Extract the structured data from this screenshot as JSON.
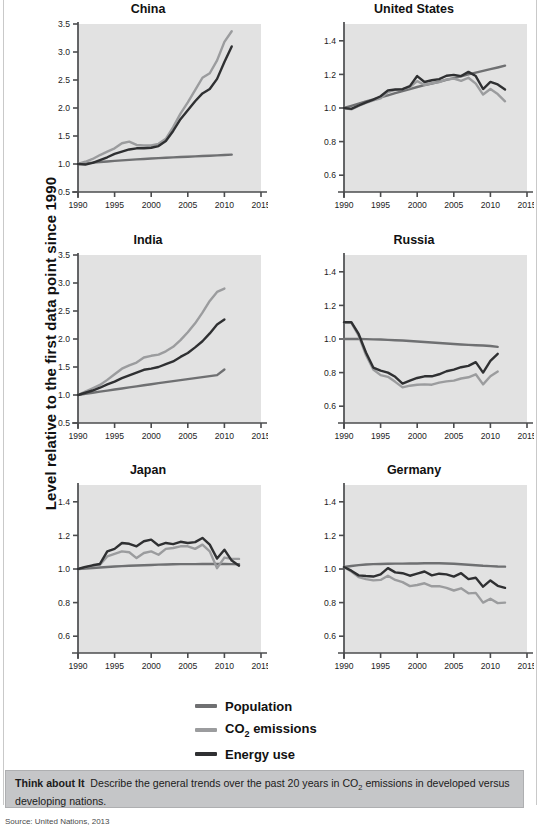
{
  "figure": {
    "ylabel": "Level relative to the first data point since 1990",
    "source": "Source: United Nations, 2013"
  },
  "legend": {
    "position": "bottom-center",
    "items": [
      {
        "label": "Population",
        "color": "#6f7072",
        "key": "population"
      },
      {
        "label": "CO2 emissions",
        "label_pre": "CO",
        "label_sub": "2",
        "label_post": " emissions",
        "color": "#9b9c9e",
        "key": "co2"
      },
      {
        "label": "Energy use",
        "color": "#2f3032",
        "key": "energy"
      }
    ]
  },
  "think_about_it": {
    "heading": "Think about It",
    "body_pre": "Describe the general trends over the past 20 years in CO",
    "body_sub": "2",
    "body_post": " emissions in developed versus developing nations."
  },
  "chart_data": [
    {
      "type": "line",
      "title": "China",
      "xlabel": "",
      "ylabel": "Level relative to the first data point since 1990",
      "xlim": [
        1990,
        2015
      ],
      "ylim": [
        0.5,
        3.5
      ],
      "xticks": [
        1990,
        1995,
        2000,
        2005,
        2010,
        2015
      ],
      "yticks": [
        0.5,
        1.0,
        1.5,
        2.0,
        2.5,
        3.0,
        3.5
      ],
      "grid": false,
      "x": [
        1990,
        1991,
        1992,
        1993,
        1994,
        1995,
        1996,
        1997,
        1998,
        1999,
        2000,
        2001,
        2002,
        2003,
        2004,
        2005,
        2006,
        2007,
        2008,
        2009,
        2010,
        2011
      ],
      "series": [
        {
          "name": "Population",
          "color": "#6f7072",
          "values": [
            1.0,
            1.012,
            1.024,
            1.035,
            1.045,
            1.055,
            1.065,
            1.074,
            1.082,
            1.09,
            1.098,
            1.105,
            1.112,
            1.118,
            1.124,
            1.13,
            1.136,
            1.142,
            1.148,
            1.154,
            1.161,
            1.168
          ]
        },
        {
          "name": "CO2 emissions",
          "color": "#9b9c9e",
          "values": [
            1.0,
            1.04,
            1.09,
            1.16,
            1.22,
            1.28,
            1.37,
            1.4,
            1.34,
            1.33,
            1.33,
            1.36,
            1.45,
            1.66,
            1.9,
            2.1,
            2.32,
            2.54,
            2.62,
            2.85,
            3.18,
            3.37
          ]
        },
        {
          "name": "Energy use",
          "color": "#2f3032",
          "values": [
            1.0,
            0.99,
            1.02,
            1.07,
            1.12,
            1.18,
            1.22,
            1.26,
            1.28,
            1.28,
            1.29,
            1.32,
            1.41,
            1.59,
            1.8,
            1.96,
            2.12,
            2.26,
            2.34,
            2.52,
            2.82,
            3.1
          ]
        }
      ]
    },
    {
      "type": "line",
      "title": "United States",
      "xlabel": "",
      "ylabel": "",
      "xlim": [
        1990,
        2015
      ],
      "ylim": [
        0.5,
        1.5
      ],
      "xticks": [
        1990,
        1995,
        2000,
        2005,
        2010,
        2015
      ],
      "yticks": [
        0.6,
        0.8,
        1.0,
        1.2,
        1.4
      ],
      "grid": false,
      "x": [
        1990,
        1991,
        1992,
        1993,
        1994,
        1995,
        1996,
        1997,
        1998,
        1999,
        2000,
        2001,
        2002,
        2003,
        2004,
        2005,
        2006,
        2007,
        2008,
        2009,
        2010,
        2011,
        2012
      ],
      "series": [
        {
          "name": "Population",
          "color": "#6f7072",
          "values": [
            1.0,
            1.013,
            1.026,
            1.039,
            1.051,
            1.063,
            1.075,
            1.088,
            1.1,
            1.112,
            1.125,
            1.136,
            1.146,
            1.156,
            1.167,
            1.178,
            1.189,
            1.2,
            1.211,
            1.221,
            1.231,
            1.241,
            1.252
          ]
        },
        {
          "name": "CO2 emissions",
          "color": "#9b9c9e",
          "values": [
            1.0,
            0.992,
            1.012,
            1.03,
            1.046,
            1.058,
            1.095,
            1.108,
            1.112,
            1.124,
            1.16,
            1.137,
            1.147,
            1.154,
            1.17,
            1.175,
            1.162,
            1.18,
            1.145,
            1.08,
            1.113,
            1.083,
            1.04
          ]
        },
        {
          "name": "Energy use",
          "color": "#2f3032",
          "values": [
            1.0,
            0.995,
            1.015,
            1.034,
            1.05,
            1.07,
            1.105,
            1.11,
            1.112,
            1.13,
            1.19,
            1.155,
            1.165,
            1.172,
            1.192,
            1.197,
            1.19,
            1.215,
            1.19,
            1.113,
            1.155,
            1.14,
            1.11
          ]
        }
      ]
    },
    {
      "type": "line",
      "title": "India",
      "xlabel": "",
      "ylabel": "",
      "xlim": [
        1990,
        2015
      ],
      "ylim": [
        0.5,
        3.5
      ],
      "xticks": [
        1990,
        1995,
        2000,
        2005,
        2010,
        2015
      ],
      "yticks": [
        0.5,
        1.0,
        1.5,
        2.0,
        2.5,
        3.0,
        3.5
      ],
      "grid": false,
      "x": [
        1990,
        1991,
        1992,
        1993,
        1994,
        1995,
        1996,
        1997,
        1998,
        1999,
        2000,
        2001,
        2002,
        2003,
        2004,
        2005,
        2006,
        2007,
        2008,
        2009,
        2010
      ],
      "series": [
        {
          "name": "Population",
          "color": "#6f7072",
          "values": [
            1.0,
            1.02,
            1.04,
            1.06,
            1.079,
            1.098,
            1.117,
            1.136,
            1.155,
            1.174,
            1.193,
            1.211,
            1.229,
            1.247,
            1.265,
            1.283,
            1.301,
            1.319,
            1.337,
            1.355,
            1.455
          ]
        },
        {
          "name": "CO2 emissions",
          "color": "#9b9c9e",
          "values": [
            1.0,
            1.06,
            1.12,
            1.18,
            1.27,
            1.37,
            1.47,
            1.53,
            1.58,
            1.67,
            1.7,
            1.72,
            1.78,
            1.86,
            1.98,
            2.12,
            2.28,
            2.47,
            2.68,
            2.84,
            2.9
          ]
        },
        {
          "name": "Energy use",
          "color": "#2f3032",
          "values": [
            1.0,
            1.04,
            1.08,
            1.13,
            1.19,
            1.24,
            1.3,
            1.35,
            1.4,
            1.45,
            1.47,
            1.5,
            1.55,
            1.6,
            1.68,
            1.75,
            1.85,
            1.96,
            2.1,
            2.26,
            2.35
          ]
        }
      ]
    },
    {
      "type": "line",
      "title": "Russia",
      "xlabel": "",
      "ylabel": "",
      "xlim": [
        1990,
        2015
      ],
      "ylim": [
        0.5,
        1.5
      ],
      "xticks": [
        1990,
        1995,
        2000,
        2005,
        2010,
        2015
      ],
      "yticks": [
        0.6,
        0.8,
        1.0,
        1.2,
        1.4
      ],
      "grid": false,
      "x": [
        1990,
        1991,
        1992,
        1993,
        1994,
        1995,
        1996,
        1997,
        1998,
        1999,
        2000,
        2001,
        2002,
        2003,
        2004,
        2005,
        2006,
        2007,
        2008,
        2009,
        2010,
        2011
      ],
      "series": [
        {
          "name": "Population",
          "color": "#6f7072",
          "values": [
            1.0,
            1.0,
            1.0,
            0.999,
            0.998,
            0.997,
            0.995,
            0.993,
            0.991,
            0.988,
            0.985,
            0.982,
            0.979,
            0.976,
            0.973,
            0.97,
            0.967,
            0.965,
            0.963,
            0.961,
            0.958,
            0.953
          ]
        },
        {
          "name": "CO2 emissions",
          "color": "#9b9c9e",
          "values": [
            1.1,
            1.098,
            1.02,
            0.905,
            0.818,
            0.785,
            0.775,
            0.745,
            0.712,
            0.722,
            0.728,
            0.73,
            0.728,
            0.74,
            0.748,
            0.752,
            0.765,
            0.772,
            0.79,
            0.73,
            0.778,
            0.806
          ]
        },
        {
          "name": "Energy use",
          "color": "#2f3032",
          "values": [
            1.1,
            1.1,
            1.03,
            0.92,
            0.83,
            0.812,
            0.8,
            0.775,
            0.735,
            0.752,
            0.768,
            0.778,
            0.778,
            0.79,
            0.808,
            0.818,
            0.832,
            0.84,
            0.862,
            0.8,
            0.87,
            0.912
          ]
        }
      ]
    },
    {
      "type": "line",
      "title": "Japan",
      "xlabel": "",
      "ylabel": "",
      "xlim": [
        1990,
        2015
      ],
      "ylim": [
        0.5,
        1.5
      ],
      "xticks": [
        1990,
        1995,
        2000,
        2005,
        2010,
        2015
      ],
      "yticks": [
        0.6,
        0.8,
        1.0,
        1.2,
        1.4
      ],
      "grid": false,
      "x": [
        1990,
        1991,
        1992,
        1993,
        1994,
        1995,
        1996,
        1997,
        1998,
        1999,
        2000,
        2001,
        2002,
        2003,
        2004,
        2005,
        2006,
        2007,
        2008,
        2009,
        2010,
        2011,
        2012
      ],
      "series": [
        {
          "name": "Population",
          "color": "#6f7072",
          "values": [
            1.0,
            1.003,
            1.006,
            1.009,
            1.012,
            1.015,
            1.017,
            1.019,
            1.021,
            1.022,
            1.024,
            1.026,
            1.027,
            1.028,
            1.029,
            1.029,
            1.029,
            1.03,
            1.03,
            1.03,
            1.03,
            1.029,
            1.028
          ]
        },
        {
          "name": "CO2 emissions",
          "color": "#9b9c9e",
          "values": [
            1.0,
            1.01,
            1.02,
            1.025,
            1.075,
            1.09,
            1.105,
            1.1,
            1.065,
            1.095,
            1.105,
            1.085,
            1.12,
            1.125,
            1.135,
            1.135,
            1.12,
            1.145,
            1.105,
            1.005,
            1.068,
            1.06,
            1.06
          ]
        },
        {
          "name": "Energy use",
          "color": "#2f3032",
          "values": [
            1.0,
            1.012,
            1.022,
            1.03,
            1.105,
            1.12,
            1.155,
            1.15,
            1.135,
            1.165,
            1.175,
            1.14,
            1.155,
            1.148,
            1.162,
            1.155,
            1.16,
            1.185,
            1.145,
            1.062,
            1.115,
            1.05,
            1.02
          ]
        }
      ]
    },
    {
      "type": "line",
      "title": "Germany",
      "xlabel": "",
      "ylabel": "",
      "xlim": [
        1990,
        2015
      ],
      "ylim": [
        0.5,
        1.5
      ],
      "xticks": [
        1990,
        1995,
        2000,
        2005,
        2010,
        2015
      ],
      "yticks": [
        0.6,
        0.8,
        1.0,
        1.2,
        1.4
      ],
      "grid": false,
      "x": [
        1990,
        1991,
        1992,
        1993,
        1994,
        1995,
        1996,
        1997,
        1998,
        1999,
        2000,
        2001,
        2002,
        2003,
        2004,
        2005,
        2006,
        2007,
        2008,
        2009,
        2010,
        2011,
        2012
      ],
      "series": [
        {
          "name": "Population",
          "color": "#6f7072",
          "values": [
            1.012,
            1.018,
            1.023,
            1.027,
            1.029,
            1.03,
            1.031,
            1.032,
            1.032,
            1.033,
            1.033,
            1.034,
            1.034,
            1.034,
            1.033,
            1.031,
            1.028,
            1.025,
            1.022,
            1.019,
            1.017,
            1.015,
            1.014
          ]
        },
        {
          "name": "CO2 emissions",
          "color": "#9b9c9e",
          "values": [
            1.012,
            0.985,
            0.952,
            0.94,
            0.932,
            0.935,
            0.96,
            0.935,
            0.922,
            0.898,
            0.905,
            0.915,
            0.897,
            0.898,
            0.888,
            0.872,
            0.885,
            0.855,
            0.858,
            0.8,
            0.823,
            0.797,
            0.8
          ]
        },
        {
          "name": "Energy use",
          "color": "#2f3032",
          "values": [
            1.012,
            0.99,
            0.962,
            0.958,
            0.955,
            0.968,
            1.005,
            0.98,
            0.975,
            0.96,
            0.972,
            0.985,
            0.962,
            0.972,
            0.968,
            0.955,
            0.975,
            0.94,
            0.948,
            0.895,
            0.932,
            0.9,
            0.888
          ]
        }
      ]
    }
  ]
}
